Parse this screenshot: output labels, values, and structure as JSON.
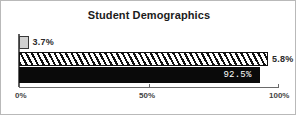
{
  "frame": {
    "border_color": "#b9b9b9",
    "background": "#ffffff"
  },
  "chart_data": {
    "type": "bar",
    "orientation": "horizontal",
    "title": "Student Demographics",
    "xlabel": "",
    "ylabel": "",
    "xlim": [
      0,
      100
    ],
    "grid": false,
    "legend": false,
    "categories": [
      "Series 1",
      "Series 2",
      "Series 3"
    ],
    "values": [
      3.7,
      95.8,
      92.5
    ],
    "data_labels": [
      "3.7%",
      "5.8%",
      "92.5%"
    ],
    "tick_labels": [
      "0%",
      "50%",
      "100%"
    ],
    "tick_values": [
      0,
      50,
      100
    ],
    "series_styles": [
      "light-gray-fill",
      "diagonal-hatch",
      "solid-black-fill"
    ],
    "colors": {
      "series_1_fill": "#d2d2d2",
      "series_1_border": "#3a3a3a",
      "series_2_fill": "#ffffff",
      "series_2_hatch": "#111111",
      "series_3_fill": "#0a0a0a",
      "label_dark": "#2a2a2a",
      "label_light": "#ffffff",
      "axis": "#6a6a6a"
    }
  },
  "axis": {
    "tick_0_label": "0%",
    "tick_50_label": "50%",
    "tick_100_label": "100%"
  }
}
